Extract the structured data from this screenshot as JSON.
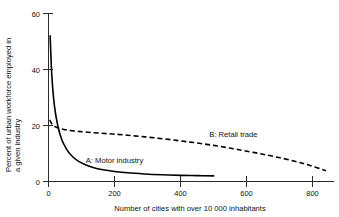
{
  "chart_data": {
    "type": "line",
    "title": "",
    "xlabel": "Number of cities with over 10 000 inhabitants",
    "ylabel": "Percent of urban workforce employed in a given industry",
    "ylabel_line1": "Percent of urban workforce employed in",
    "ylabel_line2": "a given industry",
    "xlim": [
      0,
      860
    ],
    "ylim": [
      0,
      60
    ],
    "xticks": [
      0,
      200,
      400,
      600,
      800
    ],
    "xtick_labels": [
      "0",
      "200",
      "400",
      "600",
      "800"
    ],
    "yticks": [
      0,
      20,
      40,
      60
    ],
    "ytick_labels": [
      "0",
      "20",
      "40",
      "60"
    ],
    "grid": false,
    "legend_position": "inline-annotations",
    "series": [
      {
        "name": "A: Motor industry",
        "label": "A: Motor industry",
        "style": "solid",
        "color": "#000000",
        "annotation": "A: Motor industry",
        "x": [
          5,
          10,
          18,
          28,
          40,
          55,
          70,
          90,
          110,
          135,
          165,
          200,
          240,
          290,
          345,
          400,
          450,
          500
        ],
        "y": [
          52,
          38,
          27,
          20,
          15,
          11.5,
          9.2,
          7.3,
          6.1,
          5.0,
          4.2,
          3.6,
          3.1,
          2.7,
          2.4,
          2.2,
          2.1,
          2.0
        ]
      },
      {
        "name": "B: Retail trade",
        "label": "B: Retail trade",
        "style": "dashed",
        "color": "#000000",
        "annotation": "B: Retail trade",
        "x": [
          4,
          10,
          20,
          35,
          55,
          80,
          110,
          150,
          200,
          260,
          320,
          380,
          440,
          500,
          560,
          620,
          680,
          740,
          790,
          840
        ],
        "y": [
          22.0,
          20.6,
          19.6,
          18.9,
          18.4,
          18.0,
          17.7,
          17.3,
          16.9,
          16.3,
          15.6,
          14.8,
          13.9,
          12.9,
          11.7,
          10.4,
          9.0,
          7.4,
          5.8,
          3.8
        ]
      }
    ],
    "annotations": [
      {
        "text": "A: Motor industry",
        "x": 200,
        "y": 6.5
      },
      {
        "text": "B: Retail trade",
        "x": 560,
        "y": 16.0
      }
    ]
  }
}
